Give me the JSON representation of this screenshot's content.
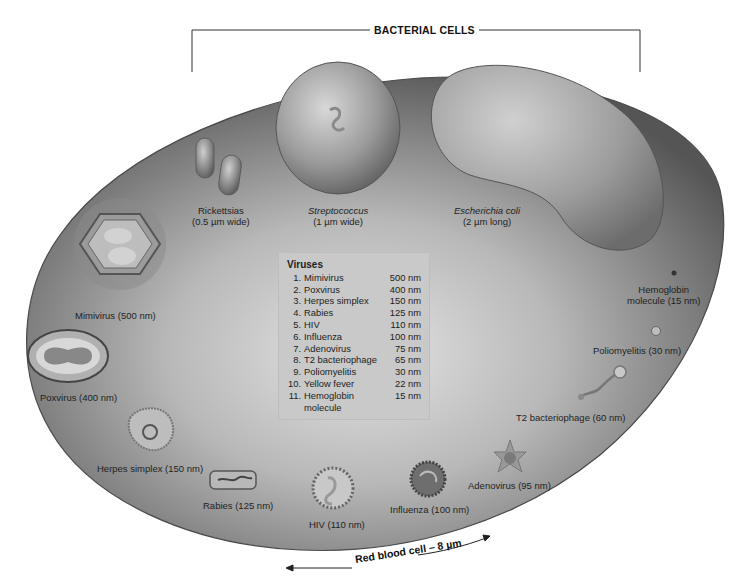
{
  "header": {
    "bracket_title": "BACTERIAL CELLS"
  },
  "bacteria": [
    {
      "name": "Rickettsias",
      "size": "(0.5 µm wide)",
      "italic": false
    },
    {
      "name": "Streptococcus",
      "size": "(1 µm wide)",
      "italic": true
    },
    {
      "name": "Escherichia coli",
      "size": "(2 µm long)",
      "italic": true
    }
  ],
  "viruses_box": {
    "title": "Viruses",
    "items": [
      {
        "num": "1.",
        "name": "Mimivirus",
        "size": "500 nm"
      },
      {
        "num": "2.",
        "name": "Poxvirus",
        "size": "400 nm"
      },
      {
        "num": "3.",
        "name": "Herpes simplex",
        "size": "150 nm"
      },
      {
        "num": "4.",
        "name": "Rabies",
        "size": "125 nm"
      },
      {
        "num": "5.",
        "name": "HIV",
        "size": "110 nm"
      },
      {
        "num": "6.",
        "name": "Influenza",
        "size": "100 nm"
      },
      {
        "num": "7.",
        "name": "Adenovirus",
        "size": "75 nm"
      },
      {
        "num": "8.",
        "name": "T2 bacteriophage",
        "size": "65 nm"
      },
      {
        "num": "9.",
        "name": "Poliomyelitis",
        "size": "30 nm"
      },
      {
        "num": "10.",
        "name": "Yellow fever",
        "size": "22 nm"
      },
      {
        "num": "11.",
        "name": "Hemoglobin",
        "name2": "molecule",
        "size": "15 nm"
      }
    ]
  },
  "specimen_labels": {
    "mimivirus": "Mimivirus (500 nm)",
    "poxvirus": "Poxvirus (400 nm)",
    "herpes": "Herpes simplex (150 nm)",
    "rabies": "Rabies (125 nm)",
    "hiv": "HIV (110 nm)",
    "influenza": "Influenza (100 nm)",
    "adenovirus": "Adenovirus (95 nm)",
    "t2": "T2 bacteriophage (60 nm)",
    "polio": "Poliomyelitis (30 nm)",
    "hemoglobin_line1": "Hemoglobin",
    "hemoglobin_line2": "molecule (15 nm)"
  },
  "scale": {
    "rbc_label": "Red blood cell – 8 µm"
  },
  "colors": {
    "cell_dark": "#5a5a5a",
    "cell_light": "#d6d6d6",
    "box_bg": "#c9c9c9"
  }
}
